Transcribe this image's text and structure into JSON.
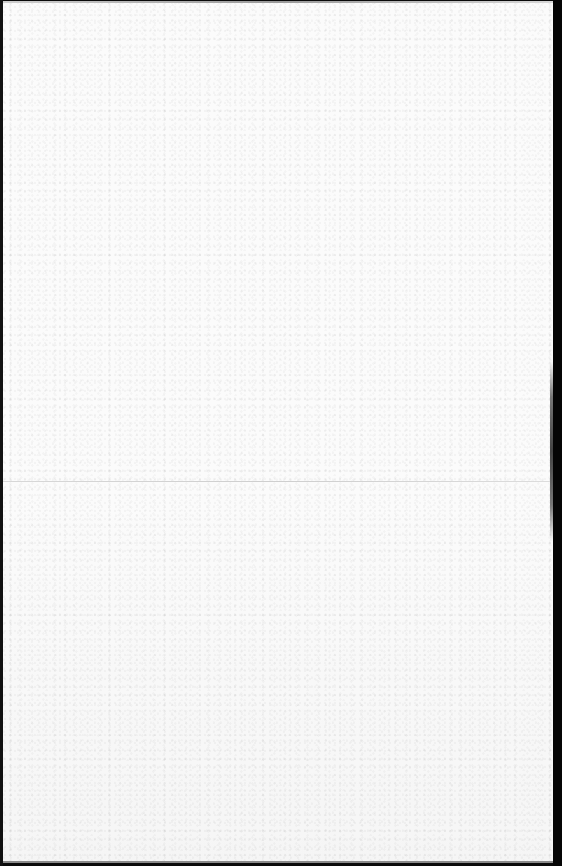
{
  "document": {
    "type": "blank-scanned-page",
    "text_content": [],
    "colors": {
      "paper": "#fbfbfb",
      "scanner_border": "#0a0a0a",
      "fold_line": "#aaaaaa"
    },
    "features": {
      "fold_line_y": 480,
      "has_text": false
    }
  }
}
